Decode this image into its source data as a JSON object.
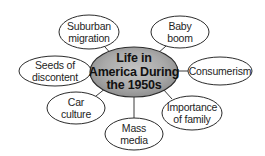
{
  "diagram": {
    "type": "concept-web",
    "center": {
      "lines": [
        "Life in",
        "America During",
        "the 1950s"
      ],
      "fill_light": "#c4c4c4",
      "fill_dark": "#8a8a8a"
    },
    "nodes": [
      {
        "id": "suburban-migration",
        "lines": [
          "Suburban",
          "migration"
        ]
      },
      {
        "id": "baby-boom",
        "lines": [
          "Baby",
          "boom"
        ]
      },
      {
        "id": "consumerism",
        "lines": [
          "Consumerism"
        ]
      },
      {
        "id": "importance-of-family",
        "lines": [
          "Importance",
          "of family"
        ]
      },
      {
        "id": "mass-media",
        "lines": [
          "Mass",
          "media"
        ]
      },
      {
        "id": "car-culture",
        "lines": [
          "Car",
          "culture"
        ]
      },
      {
        "id": "seeds-of-discontent",
        "lines": [
          "Seeds of",
          "discontent"
        ]
      }
    ]
  }
}
